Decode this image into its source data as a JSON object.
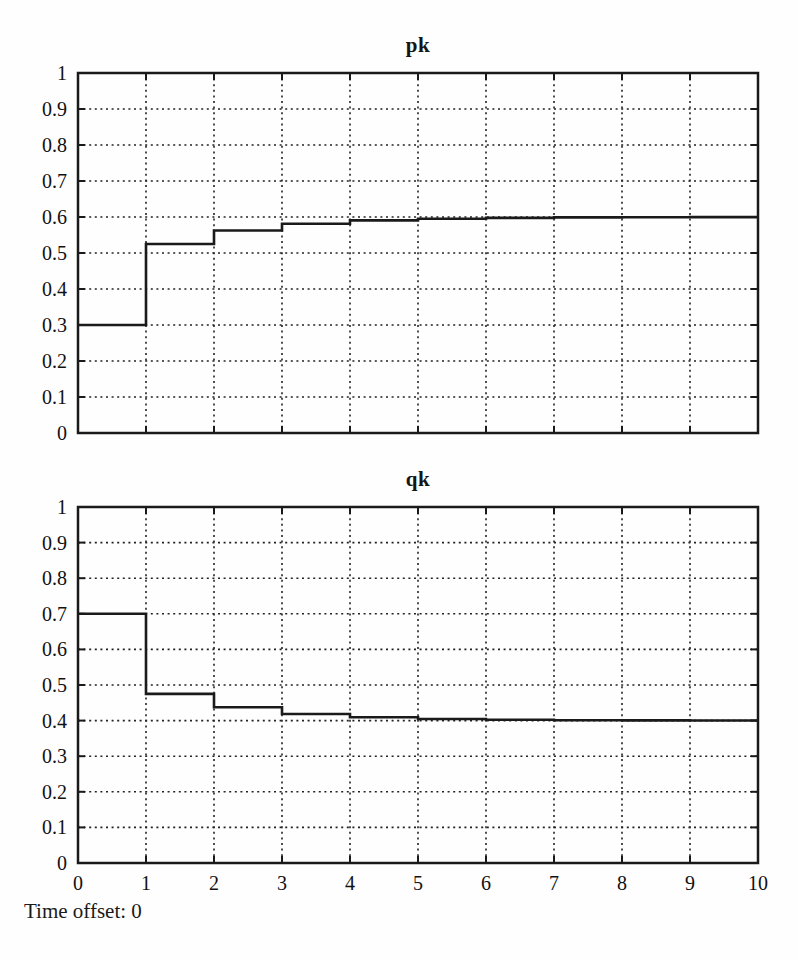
{
  "labels": {
    "time_offset": "Time offset: 0"
  },
  "chart_data": [
    {
      "type": "step",
      "title": "pk",
      "xlabel": "",
      "ylabel": "",
      "xlim": [
        0,
        10
      ],
      "ylim": [
        0,
        1
      ],
      "grid": "dotted",
      "line_color": "#1a1a1a",
      "x_step_edges": [
        0,
        1,
        2,
        3,
        4,
        5,
        6,
        7,
        8,
        9,
        10
      ],
      "levels": [
        0.3,
        0.525,
        0.5625,
        0.58125,
        0.590625,
        0.595313,
        0.597656,
        0.598828,
        0.599414,
        0.599707
      ],
      "xticks": [
        0,
        1,
        2,
        3,
        4,
        5,
        6,
        7,
        8,
        9,
        10
      ],
      "yticks": [
        0,
        0.1,
        0.2,
        0.3,
        0.4,
        0.5,
        0.6,
        0.7,
        0.8,
        0.9,
        1
      ],
      "xtick_labels": [
        "0",
        "1",
        "2",
        "3",
        "4",
        "5",
        "6",
        "7",
        "8",
        "9",
        "10"
      ],
      "ytick_labels": [
        "0",
        "0.1",
        "0.2",
        "0.3",
        "0.4",
        "0.5",
        "0.6",
        "0.7",
        "0.8",
        "0.9",
        "1"
      ],
      "show_xtick_labels": false
    },
    {
      "type": "step",
      "title": "qk",
      "xlabel": "",
      "ylabel": "",
      "xlim": [
        0,
        10
      ],
      "ylim": [
        0,
        1
      ],
      "grid": "dotted",
      "line_color": "#1a1a1a",
      "x_step_edges": [
        0,
        1,
        2,
        3,
        4,
        5,
        6,
        7,
        8,
        9,
        10
      ],
      "levels": [
        0.7,
        0.475,
        0.4375,
        0.41875,
        0.409375,
        0.404688,
        0.402344,
        0.401172,
        0.400586,
        0.400293
      ],
      "xticks": [
        0,
        1,
        2,
        3,
        4,
        5,
        6,
        7,
        8,
        9,
        10
      ],
      "yticks": [
        0,
        0.1,
        0.2,
        0.3,
        0.4,
        0.5,
        0.6,
        0.7,
        0.8,
        0.9,
        1
      ],
      "xtick_labels": [
        "0",
        "1",
        "2",
        "3",
        "4",
        "5",
        "6",
        "7",
        "8",
        "9",
        "10"
      ],
      "ytick_labels": [
        "0",
        "0.1",
        "0.2",
        "0.3",
        "0.4",
        "0.5",
        "0.6",
        "0.7",
        "0.8",
        "0.9",
        "1"
      ],
      "show_xtick_labels": true
    }
  ]
}
